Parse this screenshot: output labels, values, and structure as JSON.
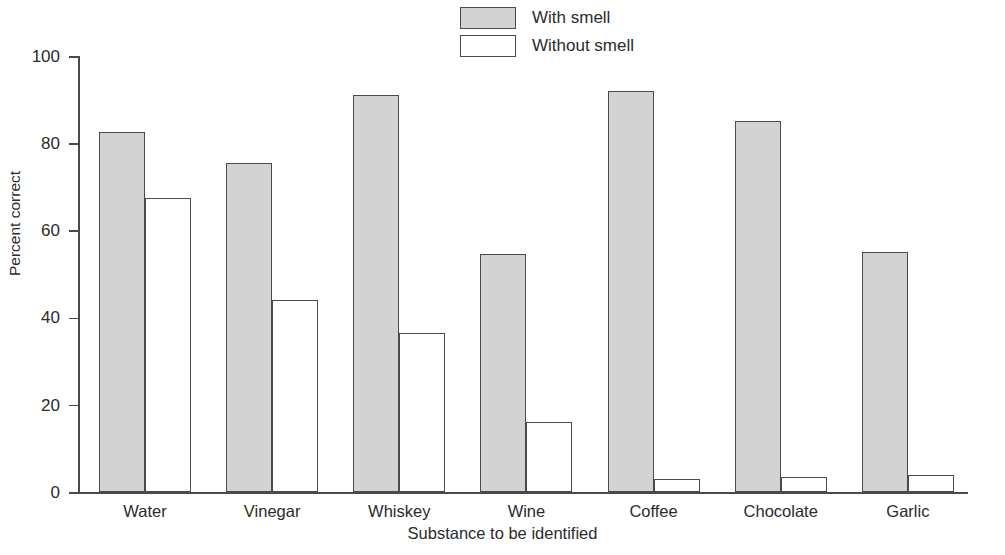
{
  "chart_data": {
    "type": "bar",
    "title": "",
    "xlabel": "Substance to be identified",
    "ylabel": "Percent correct",
    "ylim": [
      0,
      100
    ],
    "yticks": [
      0,
      20,
      40,
      60,
      80,
      100
    ],
    "grid": false,
    "legend_position": "top-center",
    "categories": [
      "Water",
      "Vinegar",
      "Whiskey",
      "Wine",
      "Coffee",
      "Chocolate",
      "Garlic"
    ],
    "series": [
      {
        "name": "With smell",
        "color": "#d3d3d3",
        "values": [
          82.5,
          75.5,
          91,
          54.5,
          92,
          85,
          55
        ]
      },
      {
        "name": "Without smell",
        "color": "#ffffff",
        "values": [
          67.5,
          44,
          36.5,
          16,
          3,
          3.5,
          4
        ]
      }
    ]
  },
  "axis": {
    "y_title": "Percent correct",
    "x_title": "Substance to be identified",
    "y_tick_labels": [
      "100",
      "80",
      "60",
      "40",
      "20",
      "0"
    ]
  },
  "legend": {
    "items": [
      {
        "label": "With smell",
        "style": "filled"
      },
      {
        "label": "Without smell",
        "style": "hollow"
      }
    ]
  }
}
